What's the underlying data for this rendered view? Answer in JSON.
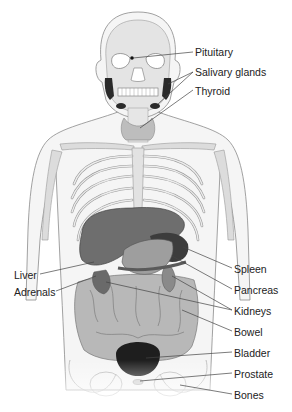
{
  "diagram": {
    "labels_right": [
      {
        "id": "pituitary",
        "text": "Pituitary"
      },
      {
        "id": "salivary",
        "text": "Salivary glands"
      },
      {
        "id": "thyroid",
        "text": "Thyroid"
      },
      {
        "id": "spleen",
        "text": "Spleen"
      },
      {
        "id": "pancreas",
        "text": "Pancreas"
      },
      {
        "id": "kidneys",
        "text": "Kidneys"
      },
      {
        "id": "bowel",
        "text": "Bowel"
      },
      {
        "id": "bladder",
        "text": "Bladder"
      },
      {
        "id": "prostate",
        "text": "Prostate"
      },
      {
        "id": "bones",
        "text": "Bones"
      }
    ],
    "labels_left": [
      {
        "id": "liver",
        "text": "Liver"
      },
      {
        "id": "adrenals",
        "text": "Adrenals"
      }
    ],
    "colors": {
      "outline": "#8a8a8a",
      "skin": "#f4f4f4",
      "bone": "#d9d9d9",
      "liver": "#6e6e6e",
      "stomach": "#9a9a9a",
      "bowel": "#b5b5b5",
      "bladder": "#1e1e1e",
      "gland_dark": "#2a2a2a",
      "thyroid": "#bdbdbd"
    }
  }
}
